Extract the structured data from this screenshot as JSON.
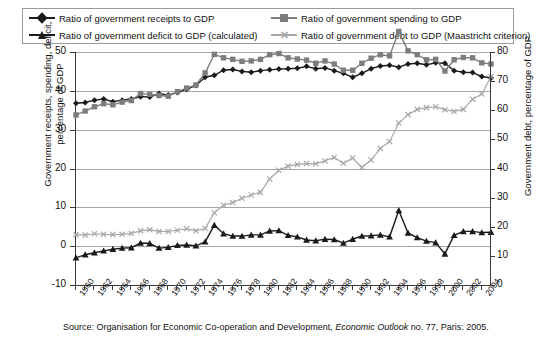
{
  "legend": {
    "items": [
      {
        "label": "Ratio of government receipts to GDP",
        "marker": "diamond-marker",
        "color": "#1a1a1a"
      },
      {
        "label": "Ratio of government spending to GDP",
        "marker": "square-marker",
        "color": "#7d7d7d"
      },
      {
        "label": "Ratio of government deficit to GDP (calculated)",
        "marker": "triangle-marker",
        "color": "#1a1a1a"
      },
      {
        "label": "Ratio of government debt to GDP (Maastricht criterion)",
        "marker": "cross-marker",
        "color": "#a8a8a8"
      }
    ]
  },
  "axes": {
    "left_title_line1": "Government receipts, spending, deficit,",
    "left_title_line2": "percentage of GDP",
    "right_title": "Government debt, percentage of GDP",
    "left_ticks": [
      "-10",
      "0",
      "10",
      "20",
      "30",
      "40",
      "50"
    ],
    "right_ticks": [
      "0",
      "10",
      "20",
      "30",
      "40",
      "50",
      "60",
      "70",
      "80"
    ]
  },
  "source": {
    "prefix": "Source: Organisation for Economic Co-operation and Development, ",
    "italic": "Economic Outlook",
    "suffix": " no. 77, Paris: 2005."
  },
  "chart_data": {
    "type": "line",
    "title": "",
    "xlabel": "",
    "ylabel": "Government receipts, spending, deficit, percentage of GDP",
    "y2label": "Government debt, percentage of GDP",
    "xlim": [
      1960,
      2005
    ],
    "ylim": [
      -10,
      50
    ],
    "y2lim": [
      0,
      80
    ],
    "grid": true,
    "legend_position": "top",
    "x": [
      1960,
      1961,
      1962,
      1963,
      1964,
      1965,
      1966,
      1967,
      1968,
      1969,
      1970,
      1971,
      1972,
      1973,
      1974,
      1975,
      1976,
      1977,
      1978,
      1979,
      1980,
      1981,
      1982,
      1983,
      1984,
      1985,
      1986,
      1987,
      1988,
      1989,
      1990,
      1991,
      1992,
      1993,
      1994,
      1995,
      1996,
      1997,
      1998,
      1999,
      2000,
      2001,
      2002,
      2003,
      2004,
      2005
    ],
    "tick_labels": [
      "1960",
      "1962",
      "1964",
      "1966",
      "1968",
      "1970",
      "1972",
      "1974",
      "1976",
      "1978",
      "1980",
      "1982",
      "1984",
      "1986",
      "1988",
      "1990",
      "1992",
      "1994",
      "1996",
      "1998",
      "2000",
      "2002",
      "2004"
    ],
    "series": [
      {
        "name": "Ratio of government receipts to GDP",
        "axis": "left",
        "color": "#1a1a1a",
        "marker": "diamond",
        "values": [
          36.8,
          37.0,
          37.6,
          37.9,
          37.2,
          37.6,
          37.9,
          38.5,
          38.4,
          39.3,
          38.9,
          39.6,
          40.4,
          41.4,
          43.5,
          44.0,
          45.3,
          45.5,
          45.0,
          44.8,
          45.2,
          45.4,
          45.6,
          45.7,
          45.8,
          46.3,
          45.7,
          45.9,
          45.2,
          44.5,
          43.5,
          44.5,
          45.7,
          46.4,
          46.6,
          46.1,
          46.9,
          47.1,
          46.7,
          47.2,
          47.1,
          45.2,
          44.8,
          44.7,
          43.7,
          43.3
        ]
      },
      {
        "name": "Ratio of government spending to GDP",
        "axis": "left",
        "color": "#7d7d7d",
        "marker": "square",
        "values": [
          33.8,
          34.8,
          35.9,
          36.7,
          36.4,
          37.1,
          37.5,
          39.3,
          39.1,
          38.8,
          38.6,
          39.8,
          40.7,
          41.5,
          44.6,
          49.4,
          48.5,
          48.1,
          47.6,
          47.7,
          48.1,
          49.3,
          49.6,
          48.5,
          48.2,
          47.9,
          47.1,
          47.7,
          46.9,
          45.3,
          45.3,
          47.1,
          48.4,
          49.3,
          49.0,
          55.3,
          50.3,
          49.3,
          48.0,
          48.1,
          45.1,
          48.0,
          48.6,
          48.5,
          47.2,
          46.9
        ]
      },
      {
        "name": "Ratio of government deficit to GDP (calculated)",
        "axis": "left",
        "color": "#1a1a1a",
        "marker": "triangle",
        "values": [
          -3.0,
          -2.2,
          -1.7,
          -1.2,
          -0.8,
          -0.5,
          -0.4,
          0.8,
          0.7,
          -0.5,
          -0.3,
          0.2,
          0.3,
          0.1,
          1.1,
          5.4,
          3.2,
          2.6,
          2.6,
          2.9,
          2.9,
          3.9,
          4.0,
          2.8,
          2.4,
          1.6,
          1.4,
          1.8,
          1.7,
          0.8,
          1.8,
          2.6,
          2.7,
          2.9,
          2.4,
          9.2,
          3.4,
          2.2,
          1.3,
          0.9,
          -2.0,
          2.8,
          3.8,
          3.8,
          3.5,
          3.6
        ]
      },
      {
        "name": "Ratio of government debt to GDP (Maastricht criterion)",
        "axis": "right",
        "color": "#a8a8a8",
        "marker": "cross",
        "values": [
          17.3,
          17.2,
          17.6,
          17.4,
          17.3,
          17.4,
          17.7,
          18.6,
          19.0,
          18.4,
          18.4,
          18.8,
          19.3,
          18.6,
          19.4,
          24.8,
          27.4,
          28.3,
          29.8,
          30.9,
          31.8,
          36.4,
          39.4,
          40.8,
          41.4,
          41.7,
          41.6,
          42.6,
          43.8,
          41.8,
          43.6,
          40.4,
          42.9,
          46.9,
          49.3,
          55.6,
          58.5,
          60.3,
          60.9,
          61.2,
          60.2,
          59.6,
          60.3,
          63.8,
          65.6,
          71.5
        ]
      }
    ]
  }
}
